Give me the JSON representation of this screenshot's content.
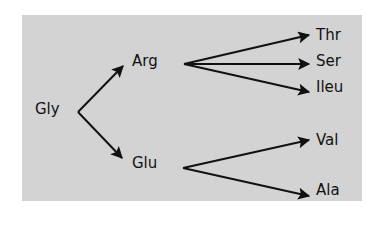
{
  "diagram": {
    "background_color": "#d3d3d3",
    "line_color": "#111111",
    "nodes": {
      "gly": "Gly",
      "arg": "Arg",
      "glu": "Glu",
      "thr": "Thr",
      "ser": "Ser",
      "ileu": "Ileu",
      "val": "Val",
      "ala": "Ala"
    },
    "edges": [
      {
        "from": "Gly",
        "to": "Arg"
      },
      {
        "from": "Gly",
        "to": "Glu"
      },
      {
        "from": "Arg",
        "to": "Thr"
      },
      {
        "from": "Arg",
        "to": "Ser"
      },
      {
        "from": "Arg",
        "to": "Ileu"
      },
      {
        "from": "Glu",
        "to": "Val"
      },
      {
        "from": "Glu",
        "to": "Ala"
      }
    ]
  }
}
